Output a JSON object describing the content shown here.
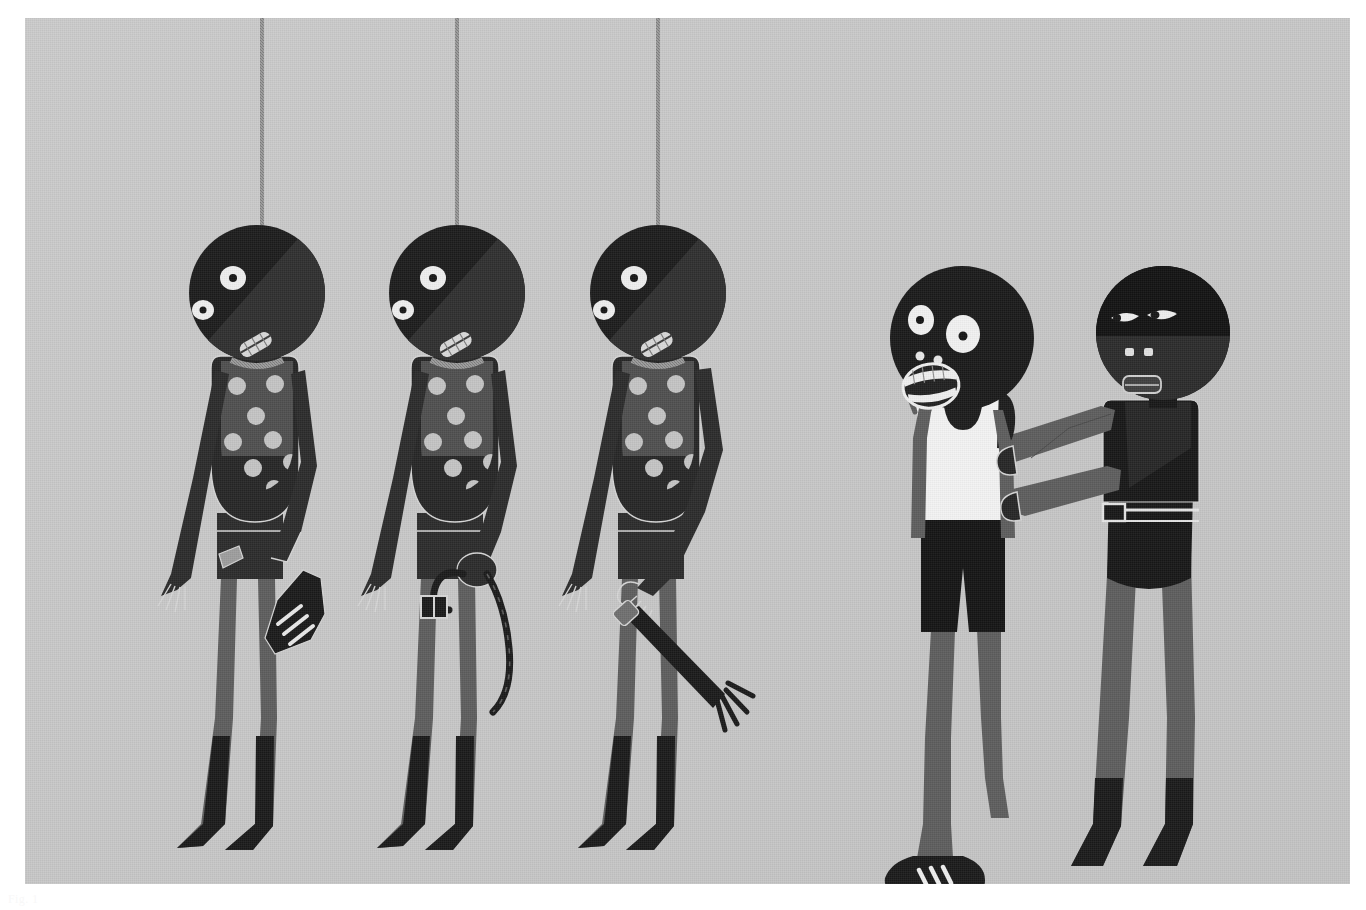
{
  "document": {
    "type": "illustration",
    "medium": "flat-vector-painting",
    "title_caption": "Fig. 1",
    "caption_visible": false
  },
  "canvas": {
    "page_width": 1366,
    "page_height": 910,
    "page_background": "#ffffff",
    "art_x": 25,
    "art_y": 18,
    "art_width": 1325,
    "art_height": 866
  },
  "palette": {
    "background": "#c8c8c8",
    "black": "#1a1a1a",
    "near_black": "#232323",
    "dark": "#2e2e2e",
    "mid_dark": "#4a4a4a",
    "mid": "#636363",
    "limb_gray": "#585858",
    "light_gray": "#b0b0b0",
    "rope": "#9a9a9a",
    "white": "#f2f2f2",
    "dot_light": "#c4c4c4",
    "outline_light": "#d6d6d6"
  },
  "scene": {
    "name": "three-hanged-figures-and-an-assault",
    "groups": [
      {
        "name": "hanged-figures",
        "count": 3
      },
      {
        "name": "standing-pair",
        "count": 2
      }
    ]
  },
  "hanged_figures": [
    {
      "id": "hanged-1",
      "label": "Hanged figure holding a sneaker",
      "head_cx": 232,
      "head_cy": 275,
      "head_r": 68,
      "rope_x": 262,
      "rope_top": 0,
      "rope_bottom": 208,
      "held_object": "sneaker",
      "held_object_detail": "three-stripe trainer",
      "torso_pattern": "polka-dots",
      "dot_count": 9
    },
    {
      "id": "hanged-2",
      "label": "Hanged figure holding a belt",
      "head_cx": 432,
      "head_cy": 275,
      "head_r": 68,
      "rope_x": 456,
      "rope_top": 0,
      "rope_bottom": 208,
      "held_object": "belt",
      "held_object_detail": "leather belt with square buckle",
      "torso_pattern": "polka-dots",
      "dot_count": 9
    },
    {
      "id": "hanged-3",
      "label": "Hanged figure holding a severed arm",
      "head_cx": 633,
      "head_cy": 275,
      "head_r": 68,
      "rope_x": 657,
      "rope_top": 0,
      "rope_bottom": 208,
      "held_object": "severed-arm",
      "held_object_detail": "detached forearm and hand",
      "torso_pattern": "polka-dots",
      "dot_count": 9
    }
  ],
  "standing_figures": [
    {
      "id": "victim",
      "label": "Frightened figure in white vest",
      "head_cx": 937,
      "head_cy": 320,
      "head_r": 72,
      "expression": "screaming",
      "eyes": "wide-round",
      "top_garment": "white-tank-top",
      "bottom_garment": "black-shorts",
      "footwear": "three-stripe-trainers",
      "pose": "arms-raised-restrained"
    },
    {
      "id": "assailant",
      "label": "Masked figure gripping the victim",
      "head_cx": 1138,
      "head_cy": 315,
      "head_r": 67,
      "expression": "neutral",
      "eyes": "narrow-almond",
      "headwear": "balaclava-mask",
      "top_garment": "dark-shirt",
      "bottom_garment": "dark-trousers-with-belt",
      "footwear": "dark-boots",
      "pose": "both-arms-extended-grabbing"
    }
  ],
  "chart_data": null
}
